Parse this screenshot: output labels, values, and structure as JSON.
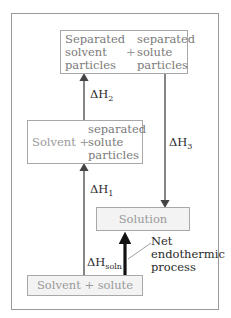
{
  "diagram": {
    "boxes": {
      "top": {
        "left_text": [
          "Separated",
          "solvent",
          "particles"
        ],
        "plus": "+",
        "right_text": [
          "separated",
          "solute",
          "particles"
        ]
      },
      "middle": {
        "left_text": "Solvent",
        "plus": "+",
        "right_text": [
          "separated",
          "solute",
          "particles"
        ]
      },
      "solution": {
        "text": "Solution"
      },
      "bottom": {
        "text": "Solvent + solute"
      }
    },
    "arrows": {
      "dH1": {
        "symbol": "ΔH",
        "subscript": "1",
        "direction": "up"
      },
      "dH2": {
        "symbol": "ΔH",
        "subscript": "2",
        "direction": "up"
      },
      "dH3": {
        "symbol": "ΔH",
        "subscript": "3",
        "direction": "down"
      },
      "dHsoln": {
        "symbol": "ΔH",
        "subscript": "soln",
        "direction": "up",
        "style": "thick"
      }
    },
    "annotation": [
      "Net",
      "endothermic",
      "process"
    ],
    "colors": {
      "frame": "#9a9a9a",
      "box_border": "#a8a8a8",
      "box_text": "#9a9a9a",
      "label_text": "#2a2a2a",
      "arrow": "#444444",
      "thick_arrow": "#111111"
    }
  }
}
